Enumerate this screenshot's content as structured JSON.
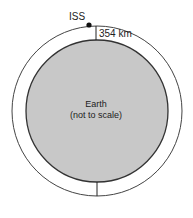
{
  "diagram": {
    "satellite_label": "ISS",
    "altitude_label": "354 km",
    "earth_label_line1": "Earth",
    "earth_label_line2": "(not to scale)",
    "colors": {
      "earth_fill": "#c8c8c8",
      "stroke": "#333333",
      "satellite": "#111111",
      "background": "#ffffff"
    }
  }
}
